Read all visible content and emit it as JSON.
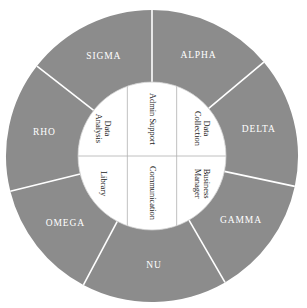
{
  "diagram": {
    "type": "concentric-wheel",
    "title": "",
    "colors": {
      "ring_fill": "#8c8c8c",
      "divider": "#ffffff",
      "hub_fill": "#ffffff",
      "hub_divider": "#b0b0b0",
      "outer_label_color": "#ffffff",
      "inner_label_color": "#1b1b1b",
      "background": "#ffffff"
    },
    "geometry": {
      "center_x": 152,
      "center_y": 156,
      "outer_radius": 146,
      "inner_radius": 74
    },
    "outer_ring": {
      "name": "outer-ring",
      "segment_count": 7,
      "segments": [
        {
          "id": "alpha",
          "label": "ALPHA",
          "start_angle": 0,
          "end_angle": 50,
          "label_angle": 25,
          "label_radius": 110
        },
        {
          "id": "delta",
          "label": "DELTA",
          "start_angle": 50,
          "end_angle": 102,
          "label_angle": 76,
          "label_radius": 110
        },
        {
          "id": "gamma",
          "label": "GAMMA",
          "start_angle": 102,
          "end_angle": 150,
          "label_angle": 126,
          "label_radius": 110
        },
        {
          "id": "nu",
          "label": "NU",
          "start_angle": 150,
          "end_angle": 208,
          "label_angle": 179,
          "label_radius": 110
        },
        {
          "id": "omega",
          "label": "OMEGA",
          "start_angle": 208,
          "end_angle": 256,
          "label_angle": 232,
          "label_radius": 110
        },
        {
          "id": "rho",
          "label": "RHO",
          "start_angle": 256,
          "end_angle": 308,
          "label_angle": 282,
          "label_radius": 110
        },
        {
          "id": "sigma",
          "label": "SIGMA",
          "start_angle": 308,
          "end_angle": 360,
          "label_angle": 334,
          "label_radius": 110
        }
      ]
    },
    "inner_hub": {
      "name": "inner-hub",
      "rows": 2,
      "columns": 3,
      "cells": [
        {
          "id": "data-analysis",
          "label": "Data Analysis",
          "lines": [
            "Data",
            "Analysis"
          ],
          "row": 0,
          "column": 0,
          "rotation": 90
        },
        {
          "id": "admin-support",
          "label": "Admin Support",
          "lines": [
            "Admin Support"
          ],
          "row": 0,
          "column": 1,
          "rotation": 90
        },
        {
          "id": "data-collection",
          "label": "Data Collection",
          "lines": [
            "Data",
            "Collection"
          ],
          "row": 0,
          "column": 2,
          "rotation": 90
        },
        {
          "id": "library",
          "label": "Library",
          "lines": [
            "Library"
          ],
          "row": 1,
          "column": 0,
          "rotation": 90
        },
        {
          "id": "communication",
          "label": "Communication",
          "lines": [
            "Communication"
          ],
          "row": 1,
          "column": 1,
          "rotation": 90
        },
        {
          "id": "business-manager",
          "label": "Business Manager",
          "lines": [
            "Business",
            "Manager"
          ],
          "row": 1,
          "column": 2,
          "rotation": 90
        }
      ]
    }
  }
}
